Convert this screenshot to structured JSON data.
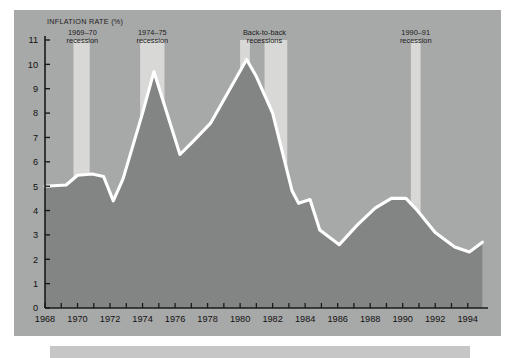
{
  "figure": {
    "background_color": "#ffffff",
    "panel_color": "#a7a8a8",
    "caption_strip_color": "#c6c6c6"
  },
  "chart_data": {
    "type": "line",
    "title": "",
    "subtitle": "",
    "ylabel": "INFLATION RATE (%)",
    "xlabel": "",
    "xlim": [
      1968,
      1995
    ],
    "ylim": [
      0,
      11
    ],
    "grid": false,
    "legend_position": "none",
    "line_color": "#ffffff",
    "fill_color": "#838484",
    "band_color": "#d8d9d6",
    "axis_color": "#1a1a1a",
    "x_tick_labels": [
      "1968",
      "1970",
      "1972",
      "1974",
      "1976",
      "1978",
      "1980",
      "1982",
      "1984",
      "1986",
      "1988",
      "1990",
      "1992",
      "1994"
    ],
    "x_tick_values": [
      1968,
      1970,
      1972,
      1974,
      1976,
      1978,
      1980,
      1982,
      1984,
      1986,
      1988,
      1990,
      1992,
      1994
    ],
    "x_minor_step": 1,
    "y_tick_labels": [
      "0",
      "1",
      "2",
      "3",
      "4",
      "5",
      "6",
      "7",
      "8",
      "9",
      "10",
      "11"
    ],
    "y_tick_values": [
      0,
      1,
      2,
      3,
      4,
      5,
      6,
      7,
      8,
      9,
      10,
      11
    ],
    "series": [
      {
        "name": "Inflation rate",
        "x": [
          1968.0,
          1969.3,
          1970.0,
          1970.9,
          1971.6,
          1972.2,
          1972.8,
          1974.0,
          1974.7,
          1976.3,
          1977.2,
          1978.2,
          1980.4,
          1981.0,
          1982.0,
          1983.2,
          1983.6,
          1984.3,
          1984.9,
          1986.1,
          1987.2,
          1988.3,
          1989.3,
          1990.2,
          1990.9,
          1992.0,
          1993.2,
          1994.1,
          1994.9
        ],
        "y": [
          5.0,
          5.05,
          5.45,
          5.5,
          5.4,
          4.4,
          5.3,
          8.0,
          9.7,
          6.3,
          6.9,
          7.6,
          10.2,
          9.5,
          8.0,
          4.8,
          4.3,
          4.45,
          3.2,
          2.6,
          3.4,
          4.1,
          4.5,
          4.5,
          4.0,
          3.1,
          2.5,
          2.3,
          2.7
        ]
      }
    ],
    "recession_bands": [
      {
        "label_line1": "1969–70",
        "label_line2": "recession",
        "start": 1969.75,
        "end": 1970.75,
        "label_x": 1970.3,
        "label_y": 11.05
      },
      {
        "label_line1": "1974–75",
        "label_line2": "recession",
        "start": 1973.85,
        "end": 1975.35,
        "label_x": 1974.6,
        "label_y": 11.05
      },
      {
        "label_line1": "Back-to-back",
        "label_line2": "recessions",
        "start": 1980.0,
        "end": 1980.6,
        "label_x": 1981.5,
        "label_y": 11.05
      },
      {
        "label_line1": "",
        "label_line2": "",
        "start": 1981.5,
        "end": 1982.9,
        "label_x": null,
        "label_y": null
      },
      {
        "label_line1": "1990–91",
        "label_line2": "recession",
        "start": 1990.5,
        "end": 1991.1,
        "label_x": 1990.8,
        "label_y": 11.05
      }
    ]
  }
}
